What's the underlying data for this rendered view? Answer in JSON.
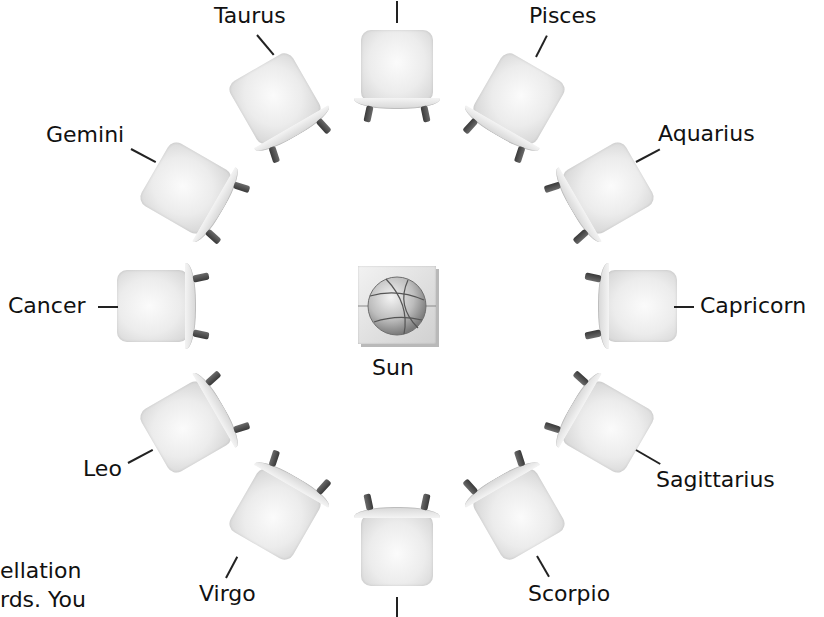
{
  "diagram": {
    "center_label": "Sun",
    "center_icon": "basketball-icon",
    "center": {
      "x": 397,
      "y": 305
    },
    "chairs": [
      {
        "id": "top",
        "label": "",
        "angle": 0
      },
      {
        "id": "pisces",
        "label": "Pisces",
        "angle": 30
      },
      {
        "id": "aquarius",
        "label": "Aquarius",
        "angle": 60
      },
      {
        "id": "capricorn",
        "label": "Capricorn",
        "angle": 90
      },
      {
        "id": "sagittarius",
        "label": "Sagittarius",
        "angle": 120
      },
      {
        "id": "scorpio",
        "label": "Scorpio",
        "angle": 150
      },
      {
        "id": "bottom",
        "label": "",
        "angle": 180
      },
      {
        "id": "virgo",
        "label": "Virgo",
        "angle": 210
      },
      {
        "id": "leo",
        "label": "Leo",
        "angle": 240
      },
      {
        "id": "cancer",
        "label": "Cancer",
        "angle": 270
      },
      {
        "id": "gemini",
        "label": "Gemini",
        "angle": 300
      },
      {
        "id": "taurus",
        "label": "Taurus",
        "angle": 330
      }
    ],
    "labels": {
      "taurus": "Taurus",
      "pisces": "Pisces",
      "gemini": "Gemini",
      "aquarius": "Aquarius",
      "cancer": "Cancer",
      "capricorn": "Capricorn",
      "leo": "Leo",
      "sagittarius": "Sagittarius",
      "virgo": "Virgo",
      "scorpio": "Scorpio",
      "sun": "Sun"
    }
  },
  "body_text_fragment": {
    "line1": "ellation",
    "line2": "rds. You"
  }
}
